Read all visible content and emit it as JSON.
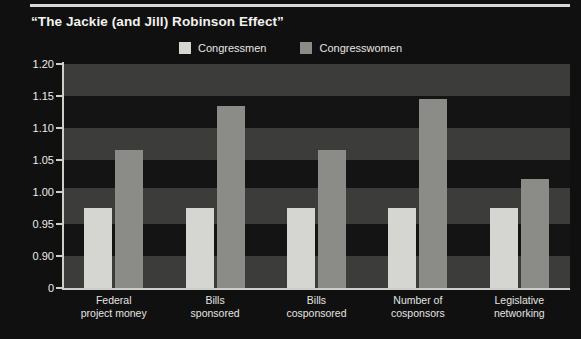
{
  "chart_data": {
    "type": "bar",
    "title": "“The Jackie (and Jill) Robinson Effect”",
    "xlabel": "",
    "ylabel": "",
    "categories": [
      "Federal\nproject money",
      "Bills\nsponsored",
      "Bills\ncosponsored",
      "Number of\ncosponsors",
      "Legislative\nnetworking"
    ],
    "series": [
      {
        "name": "Congressmen",
        "values": [
          1.0,
          1.0,
          1.0,
          1.0,
          1.0
        ],
        "color": "#d5d5d1"
      },
      {
        "name": "Congresswomen",
        "values": [
          1.09,
          1.16,
          1.09,
          1.17,
          1.045
        ],
        "color": "#8b8b88"
      }
    ],
    "ytick_labels": [
      "1.20",
      "1.15",
      "1.10",
      "1.05",
      "1.00",
      "0.95",
      "0.90",
      "0"
    ],
    "ytick_values": [
      1.2,
      1.15,
      1.1,
      1.05,
      1.0,
      0.95,
      0.9,
      0
    ],
    "ylim": [
      0.875,
      1.2
    ],
    "axis_broken_at_zero": true,
    "grid": false,
    "banded_background": true,
    "legend_position": "top-center",
    "background_color": "#101010",
    "axis_color": "#cfcfca",
    "text_color": "#e8e8e4"
  },
  "legend": {
    "entries": [
      {
        "label": "Congressmen"
      },
      {
        "label": "Congresswomen"
      }
    ]
  },
  "categories_display": [
    {
      "line1": "Federal",
      "line2": "project money"
    },
    {
      "line1": "Bills",
      "line2": "sponsored"
    },
    {
      "line1": "Bills",
      "line2": "cosponsored"
    },
    {
      "line1": "Number of",
      "line2": "cosponsors"
    },
    {
      "line1": "Legislative",
      "line2": "networking"
    }
  ]
}
